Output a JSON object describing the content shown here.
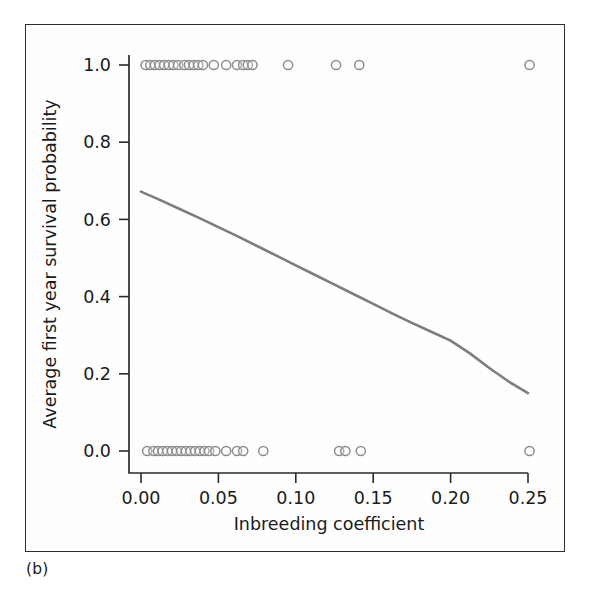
{
  "panel": {
    "label": "(b)"
  },
  "chart_data": {
    "type": "scatter",
    "title": "",
    "xlabel": "Inbreeding coefficient",
    "ylabel": "Average first year survival probability",
    "xlim": [
      -0.012,
      0.262
    ],
    "ylim": [
      -0.06,
      1.06
    ],
    "grid": false,
    "legend": null,
    "xticks": [
      0.0,
      0.05,
      0.1,
      0.15,
      0.2,
      0.25
    ],
    "xtick_labels": [
      "0.00",
      "0.05",
      "0.10",
      "0.15",
      "0.20",
      "0.25"
    ],
    "yticks": [
      0.0,
      0.2,
      0.4,
      0.6,
      0.8,
      1.0
    ],
    "ytick_labels": [
      "0.0",
      "0.2",
      "0.4",
      "0.6",
      "0.8",
      "1.0"
    ],
    "marker": {
      "shape": "open-circle",
      "radius_px": 4.6,
      "stroke": "#8d8d8d"
    },
    "series": [
      {
        "name": "Survived (y = 1)",
        "y_value": 1.0,
        "x": [
          0.003,
          0.006,
          0.009,
          0.012,
          0.015,
          0.018,
          0.021,
          0.024,
          0.028,
          0.031,
          0.034,
          0.037,
          0.04,
          0.047,
          0.055,
          0.062,
          0.066,
          0.069,
          0.072,
          0.095,
          0.126,
          0.141,
          0.251
        ]
      },
      {
        "name": "Died (y = 0)",
        "y_value": 0.0,
        "x": [
          0.004,
          0.008,
          0.011,
          0.014,
          0.017,
          0.02,
          0.023,
          0.026,
          0.029,
          0.032,
          0.035,
          0.038,
          0.041,
          0.044,
          0.048,
          0.055,
          0.062,
          0.066,
          0.079,
          0.128,
          0.132,
          0.142,
          0.251
        ]
      }
    ],
    "fitted_curve": {
      "name": "Logistic fit",
      "color": "#7d7d7d",
      "x": [
        0.0,
        0.0125,
        0.025,
        0.0375,
        0.05,
        0.0625,
        0.075,
        0.0875,
        0.1,
        0.1125,
        0.125,
        0.1375,
        0.15,
        0.1625,
        0.175,
        0.1875,
        0.2,
        0.2125,
        0.225,
        0.2375,
        0.25
      ],
      "y": [
        0.672,
        0.65,
        0.627,
        0.604,
        0.58,
        0.556,
        0.531,
        0.506,
        0.481,
        0.456,
        0.431,
        0.406,
        0.381,
        0.356,
        0.332,
        0.309,
        0.286,
        0.253,
        0.215,
        0.18,
        0.15
      ]
    }
  }
}
